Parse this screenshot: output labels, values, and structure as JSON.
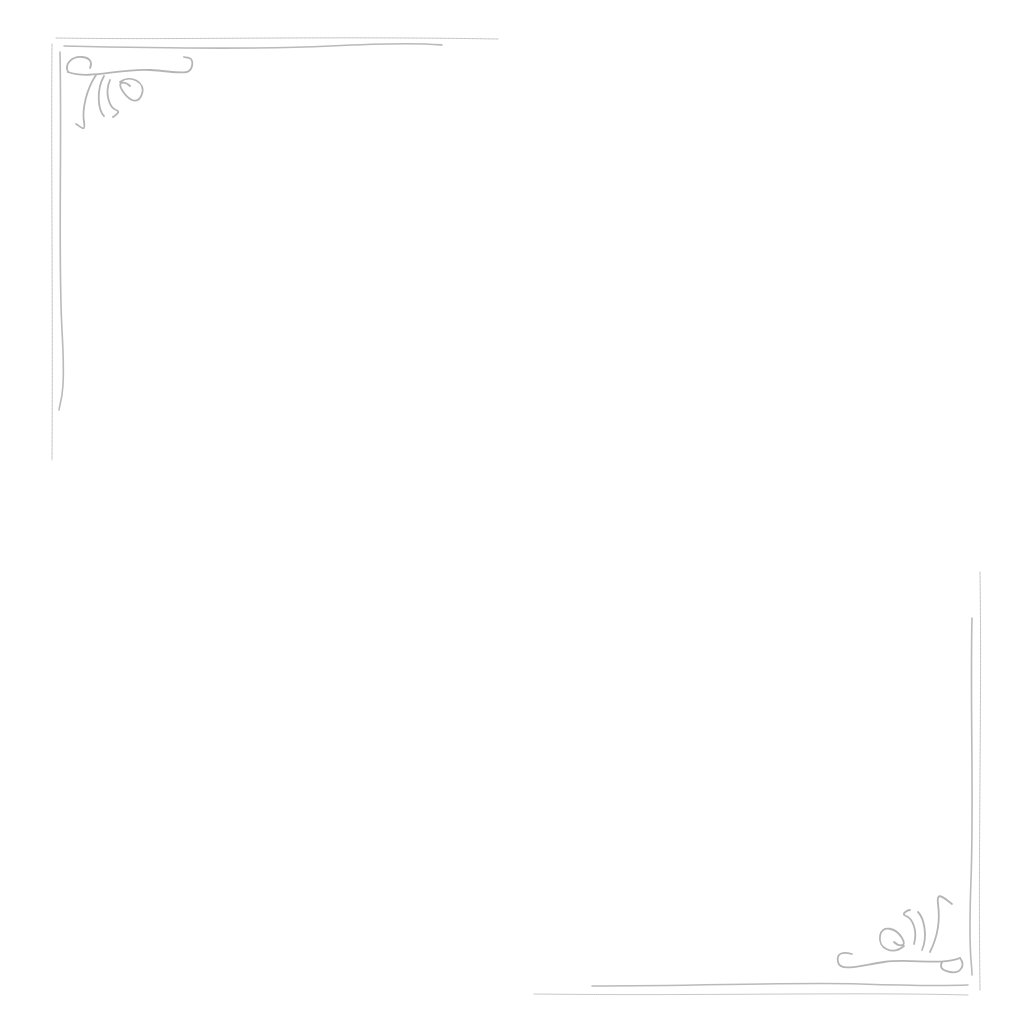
{
  "page": {
    "type": "blank-stationery",
    "background_color": "#ffffff",
    "ornament_color": "#a9a9a9",
    "ornaments": [
      {
        "name": "top-left-corner-flourish",
        "position": "top-left"
      },
      {
        "name": "bottom-right-corner-flourish",
        "position": "bottom-right"
      }
    ],
    "text": ""
  }
}
